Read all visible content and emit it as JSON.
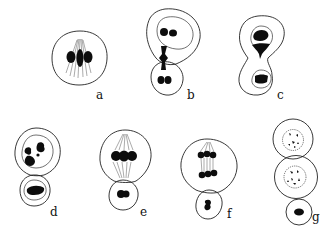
{
  "diagram": {
    "colors": {
      "line": "#222222",
      "chromatin": "#0d0d0d",
      "background": "#ffffff"
    },
    "panels": [
      {
        "id": "a",
        "label": "a"
      },
      {
        "id": "b",
        "label": "b"
      },
      {
        "id": "c",
        "label": "c"
      },
      {
        "id": "d",
        "label": "d"
      },
      {
        "id": "e",
        "label": "e"
      },
      {
        "id": "f",
        "label": "f"
      },
      {
        "id": "g",
        "label": "g"
      }
    ]
  }
}
